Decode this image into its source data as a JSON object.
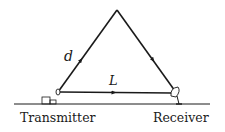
{
  "diagram": {
    "labels": {
      "direct_path": "L",
      "reflected_path": "d",
      "transmitter": "Transmitter",
      "receiver": "Receiver"
    },
    "colors": {
      "line": "#1a1a1a",
      "background": "#ffffff"
    },
    "icons": {
      "transmitter": "transmitter-building-icon",
      "receiver": "satellite-dish-icon"
    }
  }
}
